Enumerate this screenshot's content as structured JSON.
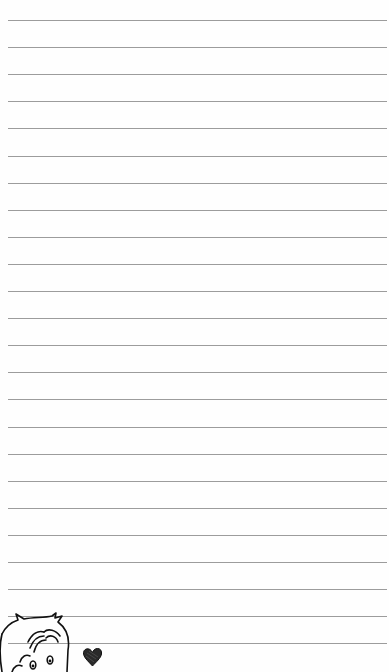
{
  "paper": {
    "background": "#fefefe",
    "rule_color": "#9c9c9c",
    "rule_count": 24,
    "first_rule_y": 20,
    "rule_spacing": 27.1
  },
  "decorations": {
    "character": "cartoon-boy-doodle",
    "heart": "heart-doodle"
  }
}
